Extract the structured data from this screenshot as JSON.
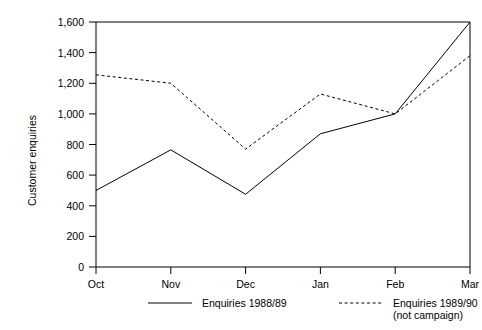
{
  "chart_data": {
    "type": "line",
    "title": "",
    "xlabel": "",
    "ylabel": "Customer enquiries",
    "categories": [
      "Oct",
      "Nov",
      "Dec",
      "Jan",
      "Feb",
      "Mar"
    ],
    "ylim": [
      0,
      1600
    ],
    "ytick_labels": [
      "0",
      "200",
      "400",
      "600",
      "800",
      "1,000",
      "1,200",
      "1,400",
      "1,600"
    ],
    "ytick_values": [
      0,
      200,
      400,
      600,
      800,
      1000,
      1200,
      1400,
      1600
    ],
    "grid": false,
    "legend_position": "bottom",
    "series": [
      {
        "name": "Enquiries 1988/89",
        "style": "solid",
        "color": "#000000",
        "values": [
          500,
          765,
          475,
          870,
          1000,
          1600
        ]
      },
      {
        "name": "Enquiries 1989/90",
        "name_line2": "(not campaign)",
        "style": "dashed",
        "color": "#000000",
        "values": [
          1255,
          1200,
          770,
          1130,
          1000,
          1380
        ]
      }
    ]
  },
  "axis": {
    "y_title": "Customer enquiries",
    "y_ticks": [
      {
        "label": "1,600"
      },
      {
        "label": "1,400"
      },
      {
        "label": "1,200"
      },
      {
        "label": "1,000"
      },
      {
        "label": "800"
      },
      {
        "label": "600"
      },
      {
        "label": "400"
      },
      {
        "label": "200"
      },
      {
        "label": "0"
      }
    ],
    "x_ticks": [
      {
        "label": "Oct"
      },
      {
        "label": "Nov"
      },
      {
        "label": "Dec"
      },
      {
        "label": "Jan"
      },
      {
        "label": "Feb"
      },
      {
        "label": "Mar"
      }
    ]
  },
  "legend": {
    "entries": [
      {
        "label": "Enquiries 1988/89",
        "label2": "",
        "style": "solid"
      },
      {
        "label": "Enquiries 1989/90",
        "label2": "(not campaign)",
        "style": "dashed"
      }
    ]
  }
}
